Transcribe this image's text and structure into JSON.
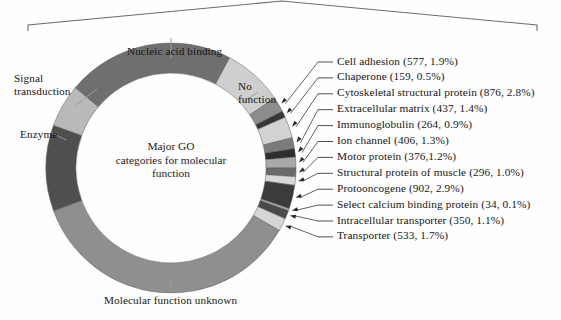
{
  "figure": {
    "center_text_lines": [
      "Major GO",
      "categories for molecular",
      "function"
    ],
    "bracket": {
      "name": "top-bracket"
    }
  },
  "chart_data": {
    "type": "pie",
    "title": "Major GO categories for molecular function",
    "subtype": "donut",
    "legend_position": "right-and-around",
    "grid": false,
    "center_label": "Major GO categories for molecular function",
    "categories": [
      "Nucleic acid binding",
      "No function",
      "Cell adhesion",
      "Chaperone",
      "Cytoskeletal structural protein",
      "Extracellular matrix",
      "Immunoglobulin",
      "Ion channel",
      "Motor protein",
      "Structural protein of muscle",
      "Protooncogene",
      "Select calcium binding protein",
      "Intracellular transporter",
      "Transporter",
      "Molecular function unknown",
      "Enzyme",
      "Signal transduction"
    ],
    "values": [
      21.7,
      7.8,
      1.9,
      0.5,
      2.8,
      1.4,
      0.9,
      1.3,
      1.2,
      1.0,
      2.9,
      0.1,
      1.1,
      1.7,
      31.0,
      10.6,
      12.1
    ],
    "unit": "percent",
    "slices": [
      {
        "label": "Nucleic acid binding",
        "percent": 21.7,
        "color": "#6f6f6f",
        "start_deg": -50,
        "end_deg": 28,
        "outside_label": true
      },
      {
        "label": "No function",
        "percent": 7.8,
        "color": "#cfcfcf",
        "start_deg": 28,
        "end_deg": 56,
        "outside_label": true
      },
      {
        "label": "Cell adhesion",
        "count": 577,
        "percent": 1.9,
        "color": "#8c8c8c",
        "start_deg": 56,
        "end_deg": 63
      },
      {
        "label": "Chaperone",
        "count": 159,
        "percent": 0.5,
        "color": "#353535",
        "start_deg": 63,
        "end_deg": 66
      },
      {
        "label": "Cytoskeletal structural protein",
        "count": 876,
        "percent": 2.8,
        "color": "#d2d2d2",
        "start_deg": 66,
        "end_deg": 76
      },
      {
        "label": "Extracellular matrix",
        "count": 437,
        "percent": 1.4,
        "color": "#7b7b7b",
        "start_deg": 76,
        "end_deg": 81
      },
      {
        "label": "Immunoglobulin",
        "count": 264,
        "percent": 0.9,
        "color": "#2e2e2e",
        "start_deg": 81,
        "end_deg": 85
      },
      {
        "label": "Ion channel",
        "count": 406,
        "percent": 1.3,
        "color": "#a9a9a9",
        "start_deg": 85,
        "end_deg": 90
      },
      {
        "label": "Motor protein",
        "count": 376,
        "percent": 1.2,
        "color": "#6a6a6a",
        "start_deg": 90,
        "end_deg": 94
      },
      {
        "label": "Structural protein of muscle",
        "count": 296,
        "percent": 1.0,
        "color": "#d8d8d8",
        "start_deg": 94,
        "end_deg": 98
      },
      {
        "label": "Protooncogene",
        "count": 902,
        "percent": 2.9,
        "color": "#3b3b3b",
        "start_deg": 98,
        "end_deg": 109
      },
      {
        "label": "Select calcium binding protein",
        "count": 34,
        "percent": 0.1,
        "color": "#b0b0b0",
        "start_deg": 109,
        "end_deg": 110
      },
      {
        "label": "Intracellular transporter",
        "count": 350,
        "percent": 1.1,
        "color": "#4a4a4a",
        "start_deg": 110,
        "end_deg": 114
      },
      {
        "label": "Transporter",
        "count": 533,
        "percent": 1.7,
        "color": "#d5d5d5",
        "start_deg": 114,
        "end_deg": 120
      },
      {
        "label": "Molecular function unknown",
        "percent": 31.0,
        "color": "#8f8f8f",
        "start_deg": 120,
        "end_deg": 250,
        "outside_label": true
      },
      {
        "label": "Enzyme",
        "percent": 10.6,
        "color": "#4f4f4f",
        "start_deg": 250,
        "end_deg": 290,
        "outside_label": true
      },
      {
        "label": "Signal transduction",
        "percent": 12.1,
        "color": "#b9b9b9",
        "start_deg": 290,
        "end_deg": 310,
        "outside_label": true
      }
    ],
    "outside_labels": [
      {
        "name": "nucleic-acid-binding",
        "text": "Nucleic acid binding"
      },
      {
        "name": "signal-transduction",
        "text": "Signal\ntransduction"
      },
      {
        "name": "enzyme",
        "text": "Enzyme"
      },
      {
        "name": "no-function",
        "text": "No\nfunction"
      },
      {
        "name": "molecular-function-unknown",
        "text": "Molecular function unknown"
      }
    ],
    "leader_labels": [
      {
        "name": "cell-adhesion",
        "text": "Cell adhesion (577, 1.9%)"
      },
      {
        "name": "chaperone",
        "text": "Chaperone (159, 0.5%)"
      },
      {
        "name": "cytoskeletal-structural-protein",
        "text": "Cytoskeletal structural protein (876, 2.8%)"
      },
      {
        "name": "extracellular-matrix",
        "text": "Extracellular matrix (437, 1.4%)"
      },
      {
        "name": "immunoglobulin",
        "text": "Immunoglobulin (264, 0.9%)"
      },
      {
        "name": "ion-channel",
        "text": "Ion channel (406, 1.3%)"
      },
      {
        "name": "motor-protein",
        "text": "Motor protein (376,1.2%)"
      },
      {
        "name": "structural-protein-of-muscle",
        "text": "Structural protein of muscle (296, 1.0%)"
      },
      {
        "name": "protooncogene",
        "text": "Protooncogene (902, 2.9%)"
      },
      {
        "name": "select-calcium-binding-protein",
        "text": "Select calcium binding protein (34, 0.1%)"
      },
      {
        "name": "intracellular-transporter",
        "text": "Intracellular transporter (350, 1.1%)"
      },
      {
        "name": "transporter",
        "text": "Transporter (533, 1.7%)"
      }
    ]
  },
  "labels": {
    "nucleic_acid_binding": "Nucleic acid binding",
    "signal_transduction_l1": "Signal",
    "signal_transduction_l2": "transduction",
    "enzyme": "Enzyme",
    "no_function_l1": "No",
    "no_function_l2": "function",
    "molecular_function_unknown": "Molecular function unknown",
    "center_l1": "Major GO",
    "center_l2": "categories for molecular",
    "center_l3": "function"
  }
}
